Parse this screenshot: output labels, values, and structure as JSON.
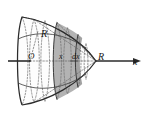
{
  "figure": {
    "labels": {
      "origin": "O",
      "radius_top": "R",
      "slice_position": "x",
      "slice_thickness": "dx",
      "vertex_radius": "R",
      "axis_x": "x"
    },
    "colors": {
      "shaded_slab": "#b3b3b3",
      "shaded_slab_dark": "#9c9c9c",
      "body_fill": "#ffffff",
      "outline": "#2b2b2b",
      "dashed": "#5a5a5a",
      "axis": "#2b2b2b",
      "background": "#ffffff"
    },
    "geometry": {
      "axis_y": 61,
      "axis_start_x": 8,
      "axis_end_x": 141,
      "vertex_x": 96,
      "base_x": 22,
      "slab_left_x": 57,
      "slab_right_x": 78,
      "semi_axis_y": 44
    }
  }
}
